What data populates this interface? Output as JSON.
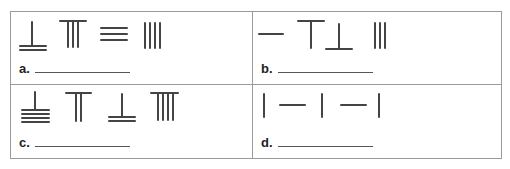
{
  "worksheet": {
    "problems": [
      {
        "label": "a.",
        "answer_value": "",
        "symbols": [
          "rod-1-over-2-bars",
          "rod-3-under-bar",
          "bars-3",
          "rods-4"
        ],
        "symbol_descriptions": [
          "vertical rod above 2 horizontal bars",
          "3 vertical rods under a horizontal bar",
          "3 horizontal bars",
          "4 vertical rods"
        ]
      },
      {
        "label": "b.",
        "answer_value": "",
        "symbols": [
          "bar-1",
          "rod-1-under-bar",
          "rod-1-over-bar",
          "rods-3"
        ],
        "symbol_descriptions": [
          "1 horizontal bar",
          "1 vertical rod under a horizontal bar",
          "1 vertical rod above a horizontal bar",
          "3 vertical rods"
        ]
      },
      {
        "label": "c.",
        "answer_value": "",
        "symbols": [
          "rod-1-over-4-bars",
          "rod-2-under-bar",
          "rod-1-over-2-bars",
          "rod-4-under-bar"
        ],
        "symbol_descriptions": [
          "vertical rod above 4 horizontal bars",
          "2 vertical rods under a horizontal bar",
          "vertical rod above 2 horizontal bars",
          "4 vertical rods under a horizontal bar"
        ]
      },
      {
        "label": "d.",
        "answer_value": "",
        "symbols": [
          "rod-1",
          "bar-1",
          "rod-1",
          "bar-1",
          "rod-1"
        ],
        "symbol_descriptions": [
          "1 vertical rod",
          "1 horizontal bar",
          "1 vertical rod",
          "1 horizontal bar",
          "1 vertical rod"
        ]
      }
    ],
    "colors": {
      "stroke": "#444444",
      "border": "#9a9a9a",
      "answer_line": "#555555"
    }
  }
}
